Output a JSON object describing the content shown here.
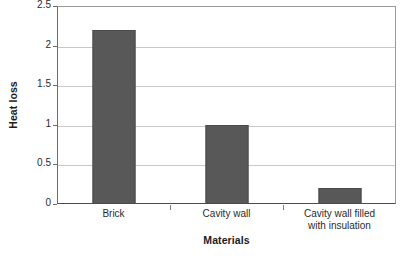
{
  "chart_data": {
    "type": "bar",
    "title": "",
    "categories": [
      "Brick",
      "Cavity wall",
      "Cavity wall filled with insulation"
    ],
    "category_lines": [
      [
        "Brick"
      ],
      [
        "Cavity wall"
      ],
      [
        "Cavity wall filled",
        "with insulation"
      ]
    ],
    "values": [
      2.2,
      1.0,
      0.2
    ],
    "xlabel": "Materials",
    "ylabel": "Heat loss",
    "ylim": [
      0,
      2.5
    ],
    "yticks": [
      "0",
      "0.5",
      "1",
      "1.5",
      "2",
      "2.5"
    ],
    "ytick_values": [
      0,
      0.5,
      1,
      1.5,
      2,
      2.5
    ],
    "grid": true,
    "legend": "none",
    "bar_color": "#585858",
    "gridline_color": "#c9c9c9",
    "background_color": "#ffffff"
  }
}
